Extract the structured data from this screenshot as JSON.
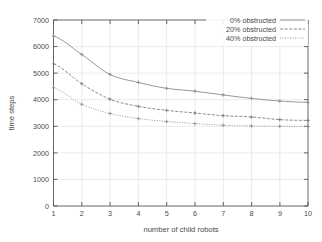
{
  "chart_data": {
    "type": "line",
    "title": "",
    "xlabel": "number of child robots",
    "ylabel": "time steps",
    "xlim": [
      1,
      10
    ],
    "ylim": [
      0,
      7000
    ],
    "xticks": [
      "1",
      "2",
      "3",
      "4",
      "5",
      "6",
      "7",
      "8",
      "9",
      "10"
    ],
    "yticks": [
      "0",
      "1000",
      "2000",
      "3000",
      "4000",
      "5000",
      "6000",
      "7000"
    ],
    "grid": true,
    "legend_position": "top-right",
    "x": [
      1,
      2,
      3,
      4,
      5,
      6,
      7,
      8,
      9,
      10
    ],
    "series": [
      {
        "name": "0% obstructed",
        "style": "solid",
        "color": "#8a8a8a",
        "values": [
          6400,
          5700,
          4950,
          4650,
          4430,
          4320,
          4180,
          4050,
          3950,
          3900
        ]
      },
      {
        "name": "20% obstructed",
        "style": "dashed",
        "color": "#7a7a7a",
        "values": [
          5350,
          4600,
          4020,
          3750,
          3600,
          3500,
          3400,
          3350,
          3250,
          3220
        ]
      },
      {
        "name": "40% obstructed",
        "style": "dotted",
        "color": "#8a8a8a",
        "values": [
          4450,
          3830,
          3480,
          3290,
          3180,
          3100,
          3040,
          3010,
          3000,
          2990
        ]
      }
    ]
  },
  "axis": {
    "x_title": "number of child robots",
    "y_title": "time steps",
    "x_tick_1": "1",
    "x_tick_2": "2",
    "x_tick_3": "3",
    "x_tick_4": "4",
    "x_tick_5": "5",
    "x_tick_6": "6",
    "x_tick_7": "7",
    "x_tick_8": "8",
    "x_tick_9": "9",
    "x_tick_10": "10",
    "y_tick_0": "0",
    "y_tick_1000": "1000",
    "y_tick_2000": "2000",
    "y_tick_3000": "3000",
    "y_tick_4000": "4000",
    "y_tick_5000": "5000",
    "y_tick_6000": "6000",
    "y_tick_7000": "7000"
  },
  "legend": {
    "entry_0": "0% obstructed",
    "entry_1": "20% obstructed",
    "entry_2": "40% obstructed"
  },
  "colors": {
    "axis": "#555555",
    "grid": "#d8d8d8",
    "series_0": "#8a8a8a",
    "series_1": "#7a7a7a",
    "series_2": "#8a8a8a",
    "text": "#4a4a4a",
    "background": "#ffffff"
  }
}
